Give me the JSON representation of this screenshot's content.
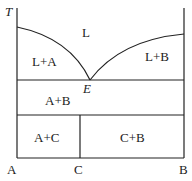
{
  "diagram": {
    "axis_label": "T",
    "regions": {
      "liquid": "L",
      "l_a": "L+A",
      "l_b": "L+B",
      "a_b": "A+B",
      "a_c": "A+C",
      "c_b": "C+B"
    },
    "eutectic_point": "E",
    "x_labels": {
      "a": "A",
      "c": "C",
      "b": "B"
    }
  }
}
